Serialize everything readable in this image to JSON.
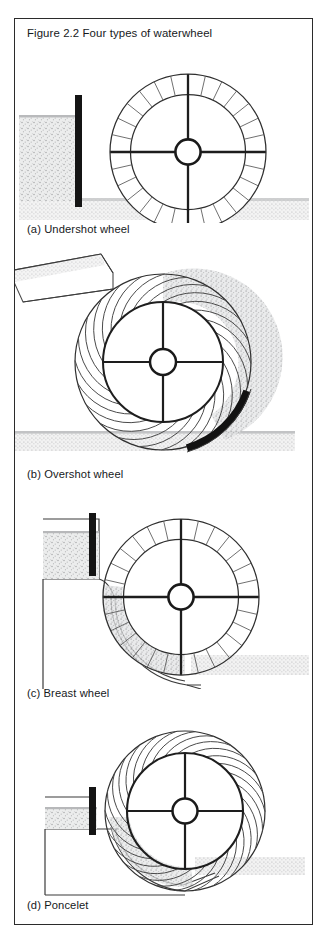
{
  "document": {
    "type": "scanned-book-figure",
    "page_background": "#ffffff",
    "frame_border_color": "#2b2b2b"
  },
  "figure": {
    "title": "Figure 2.2 Four types of waterwheel",
    "panels": [
      {
        "id": "a",
        "caption": "(a) Undershot wheel",
        "wheel_type": "undershot",
        "blade_count": 28,
        "blade_shape": "straight-radial",
        "features": [
          "vertical-sluice-gate",
          "headrace-water",
          "tailrace-water-band"
        ]
      },
      {
        "id": "b",
        "caption": "(b) Overshot wheel",
        "wheel_type": "overshot",
        "blade_count": 24,
        "blade_shape": "curved-bucket",
        "features": [
          "inclined-flume-chute",
          "filled-buckets-shading",
          "dark-apron-arc",
          "tailrace-water-band"
        ]
      },
      {
        "id": "c",
        "caption": "(c) Breast wheel",
        "wheel_type": "breast",
        "blade_count": 28,
        "blade_shape": "straight-radial",
        "features": [
          "sluice-gate",
          "headrace-water",
          "breast-channel",
          "filled-buckets-shading",
          "tailrace-water-band"
        ]
      },
      {
        "id": "d",
        "caption": "(d) Poncelet",
        "wheel_type": "poncelet",
        "blade_count": 26,
        "blade_shape": "curved-vane",
        "features": [
          "sluice-gate",
          "headrace-water",
          "curved-tailrace-channel",
          "filled-vanes-shading",
          "tailrace-water-band"
        ]
      }
    ],
    "colors": {
      "ink": "#1c1c1c",
      "line": "#3a3a3a",
      "hatch_light": "#d4d4d4",
      "hatch_mid": "#bfbfbf",
      "dark_fill": "#161616",
      "paper": "#ffffff"
    }
  }
}
